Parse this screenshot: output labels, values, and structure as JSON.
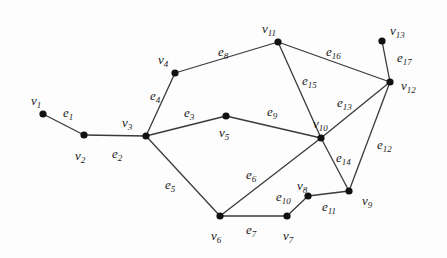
{
  "graph": {
    "nodes": [
      {
        "id": "v1",
        "name": "v",
        "sub": "1",
        "x": 43,
        "y": 114,
        "lx": 31,
        "ly": 94
      },
      {
        "id": "v2",
        "name": "v",
        "sub": "2",
        "x": 84,
        "y": 135,
        "lx": 75,
        "ly": 149
      },
      {
        "id": "v3",
        "name": "v",
        "sub": "3",
        "x": 146,
        "y": 136,
        "lx": 122,
        "ly": 116
      },
      {
        "id": "v4",
        "name": "v",
        "sub": "4",
        "x": 175,
        "y": 73,
        "lx": 158,
        "ly": 53
      },
      {
        "id": "v5",
        "name": "v",
        "sub": "5",
        "x": 226,
        "y": 116,
        "lx": 219,
        "ly": 126
      },
      {
        "id": "v6",
        "name": "v",
        "sub": "6",
        "x": 220,
        "y": 216,
        "lx": 211,
        "ly": 229
      },
      {
        "id": "v7",
        "name": "v",
        "sub": "7",
        "x": 287,
        "y": 216,
        "lx": 283,
        "ly": 229
      },
      {
        "id": "v8",
        "name": "v",
        "sub": "8",
        "x": 308,
        "y": 196,
        "lx": 297,
        "ly": 179
      },
      {
        "id": "v9",
        "name": "v",
        "sub": "9",
        "x": 349,
        "y": 191,
        "lx": 362,
        "ly": 194
      },
      {
        "id": "v10",
        "name": "v",
        "sub": "10",
        "x": 321,
        "y": 138,
        "lx": 313,
        "ly": 117
      },
      {
        "id": "v11",
        "name": "v",
        "sub": "11",
        "x": 278,
        "y": 42,
        "lx": 262,
        "ly": 22
      },
      {
        "id": "v12",
        "name": "v",
        "sub": "12",
        "x": 390,
        "y": 82,
        "lx": 401,
        "ly": 79
      },
      {
        "id": "v13",
        "name": "v",
        "sub": "13",
        "x": 382,
        "y": 41,
        "lx": 390,
        "ly": 24
      }
    ],
    "edges": [
      {
        "id": "e1",
        "name": "e",
        "sub": "1",
        "from": "v1",
        "to": "v2",
        "lx": 63,
        "ly": 106
      },
      {
        "id": "e2",
        "name": "e",
        "sub": "2",
        "from": "v2",
        "to": "v3",
        "lx": 112,
        "ly": 147
      },
      {
        "id": "e3",
        "name": "e",
        "sub": "3",
        "from": "v3",
        "to": "v5",
        "lx": 184,
        "ly": 106
      },
      {
        "id": "e4",
        "name": "e",
        "sub": "4",
        "from": "v3",
        "to": "v4",
        "lx": 150,
        "ly": 89
      },
      {
        "id": "e5",
        "name": "e",
        "sub": "5",
        "from": "v3",
        "to": "v6",
        "lx": 165,
        "ly": 178
      },
      {
        "id": "e6",
        "name": "e",
        "sub": "6",
        "from": "v6",
        "to": "v10",
        "lx": 246,
        "ly": 168
      },
      {
        "id": "e7",
        "name": "e",
        "sub": "7",
        "from": "v6",
        "to": "v7",
        "lx": 246,
        "ly": 223
      },
      {
        "id": "e8",
        "name": "e",
        "sub": "8",
        "from": "v4",
        "to": "v11",
        "lx": 218,
        "ly": 45
      },
      {
        "id": "e9",
        "name": "e",
        "sub": "9",
        "from": "v5",
        "to": "v10",
        "lx": 267,
        "ly": 105
      },
      {
        "id": "e10",
        "name": "e",
        "sub": "10",
        "from": "v7",
        "to": "v8",
        "lx": 276,
        "ly": 190
      },
      {
        "id": "e11",
        "name": "e",
        "sub": "11",
        "from": "v8",
        "to": "v9",
        "lx": 322,
        "ly": 200
      },
      {
        "id": "e12",
        "name": "e",
        "sub": "12",
        "from": "v9",
        "to": "v12",
        "lx": 377,
        "ly": 138
      },
      {
        "id": "e13",
        "name": "e",
        "sub": "13",
        "from": "v10",
        "to": "v12",
        "lx": 337,
        "ly": 96
      },
      {
        "id": "e14",
        "name": "e",
        "sub": "14",
        "from": "v10",
        "to": "v9",
        "lx": 336,
        "ly": 151
      },
      {
        "id": "e15",
        "name": "e",
        "sub": "15",
        "from": "v11",
        "to": "v10",
        "lx": 302,
        "ly": 74
      },
      {
        "id": "e16",
        "name": "e",
        "sub": "16",
        "from": "v11",
        "to": "v12",
        "lx": 326,
        "ly": 45
      },
      {
        "id": "e17",
        "name": "e",
        "sub": "17",
        "from": "v13",
        "to": "v12",
        "lx": 397,
        "ly": 51
      }
    ]
  }
}
